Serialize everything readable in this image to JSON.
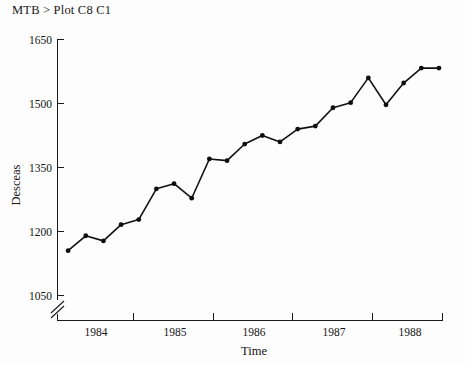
{
  "session": {
    "prompt_line": "MTB > Plot C8 C1"
  },
  "chart_data": {
    "type": "line",
    "title": "",
    "xlabel": "Time",
    "ylabel": "Desceas",
    "ylim": [
      1050,
      1650
    ],
    "ytick_labels": [
      "1050",
      "1200",
      "1350",
      "1500",
      "1650"
    ],
    "ytick_values": [
      1050,
      1200,
      1350,
      1500,
      1650
    ],
    "xtick_labels": [
      "1984",
      "1985",
      "1986",
      "1987",
      "1988"
    ],
    "xtick_values": [
      1984,
      1985,
      1986,
      1987,
      1988
    ],
    "axis_break": true,
    "axis_break_note": "y-axis broken below 1050",
    "grid": false,
    "legend": "none",
    "marker": "filled-circle",
    "x": [
      1983.75,
      1984.0,
      1984.25,
      1984.5,
      1984.75,
      1985.0,
      1985.25,
      1985.5,
      1985.75,
      1986.0,
      1986.25,
      1986.5,
      1986.75,
      1987.0,
      1987.25,
      1987.5,
      1987.75,
      1988.0,
      1988.25,
      1988.5,
      1988.75,
      1989.0
    ],
    "values": [
      1155,
      1190,
      1178,
      1216,
      1228,
      1300,
      1312,
      1278,
      1370,
      1366,
      1405,
      1425,
      1410,
      1440,
      1447,
      1490,
      1502,
      1560,
      1497,
      1548,
      1583,
      1583
    ],
    "series": [
      {
        "name": "C1",
        "values": [
          1155,
          1190,
          1178,
          1216,
          1228,
          1300,
          1312,
          1278,
          1370,
          1366,
          1405,
          1425,
          1410,
          1440,
          1447,
          1490,
          1502,
          1560,
          1497,
          1548,
          1583,
          1583
        ]
      }
    ]
  }
}
